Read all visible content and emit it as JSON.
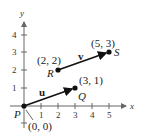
{
  "diagram": {
    "axes": {
      "x_label": "x",
      "y_label": "y",
      "x_ticks": [
        "1",
        "2",
        "3",
        "4",
        "5"
      ],
      "y_ticks": [
        "1",
        "2",
        "3",
        "4"
      ],
      "axis_color": "#666666"
    },
    "points": {
      "P": {
        "name": "P",
        "coords": "(0, 0)"
      },
      "Q": {
        "name": "Q",
        "coords": "(3, 1)"
      },
      "R": {
        "name": "R",
        "coords": "(2, 2)"
      },
      "S": {
        "name": "S",
        "coords": "(5, 3)"
      }
    },
    "vectors": {
      "u": {
        "label": "u",
        "from": "P",
        "to": "Q"
      },
      "v": {
        "label": "v",
        "from": "R",
        "to": "S"
      }
    },
    "vector_color": "#111111"
  }
}
